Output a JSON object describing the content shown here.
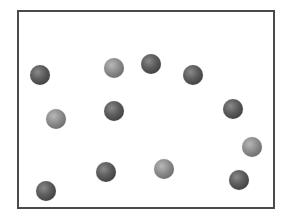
{
  "diagram": {
    "type": "particle-box",
    "frame": {
      "left": 17,
      "top": 10,
      "right": 273,
      "bottom": 207,
      "border_color": "#4a4a4a"
    },
    "particle_radius": 10,
    "colors": {
      "dark": "#4a4a4a",
      "light": "#858585"
    },
    "particles": [
      {
        "x": 40,
        "y": 75,
        "tone": "dark"
      },
      {
        "x": 114,
        "y": 68,
        "tone": "light"
      },
      {
        "x": 151,
        "y": 64,
        "tone": "dark"
      },
      {
        "x": 193,
        "y": 75,
        "tone": "dark"
      },
      {
        "x": 56,
        "y": 119,
        "tone": "light"
      },
      {
        "x": 114,
        "y": 111,
        "tone": "dark"
      },
      {
        "x": 233,
        "y": 109,
        "tone": "dark"
      },
      {
        "x": 252,
        "y": 147,
        "tone": "light"
      },
      {
        "x": 106,
        "y": 172,
        "tone": "dark"
      },
      {
        "x": 164,
        "y": 169,
        "tone": "light"
      },
      {
        "x": 239,
        "y": 180,
        "tone": "dark"
      },
      {
        "x": 46,
        "y": 191,
        "tone": "dark"
      }
    ]
  }
}
